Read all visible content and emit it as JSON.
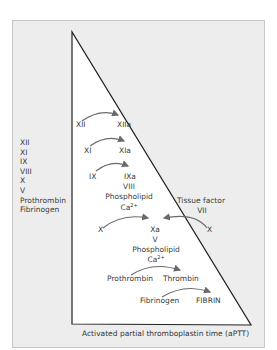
{
  "diagram": {
    "left_factor_list": [
      "XII",
      "XI",
      "IX",
      "VIII",
      "X",
      "V",
      "Prothrombin",
      "Fibrinogen"
    ],
    "cascade": [
      {
        "from": "XII",
        "to": "XIIa"
      },
      {
        "from": "XI",
        "to": "XIa"
      },
      {
        "from": "IX",
        "to": "IXa",
        "cofactors": [
          "VIII",
          "Phospholipid",
          "Ca"
        ]
      },
      {
        "from": "X",
        "to": "Xa",
        "cofactors": [
          "V",
          "Phospholipid",
          "Ca"
        ]
      },
      {
        "from": "Prothrombin",
        "to": "Thrombin"
      },
      {
        "from": "Fibrinogen",
        "to": "FIBRIN"
      }
    ],
    "extrinsic": {
      "label": "Tissue factor",
      "factor": "VII",
      "substrate": "X"
    },
    "labels": {
      "xii": "XII",
      "xiia": "XIIa",
      "xi": "XI",
      "xia": "XIa",
      "ix": "IX",
      "ixa": "IXa",
      "viii": "VIII",
      "phospholipid_1": "Phospholipid",
      "ca_1": "Ca",
      "ca_1_sup": "2+",
      "x_left": "X",
      "xa": "Xa",
      "v": "V",
      "phospholipid_2": "Phospholipid",
      "ca_2": "Ca",
      "ca_2_sup": "2+",
      "tissue_factor": "Tissue factor",
      "vii": "VII",
      "x_right": "X",
      "prothrombin": "Prothrombin",
      "thrombin": "Thrombin",
      "fibrinogen": "Fibrinogen",
      "fibrin": "FIBRIN"
    },
    "caption": "Activated partial thromboplastin time (aPTT)",
    "colors": {
      "background_panel": "#ededed",
      "triangle_fill": "#ffffff",
      "outline": "#222222",
      "arrow": "#6a6a6a"
    }
  }
}
